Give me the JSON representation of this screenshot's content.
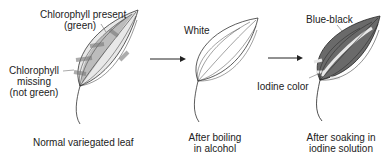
{
  "panels": [
    {
      "caption": "Normal variegated leaf",
      "labels": {
        "top_line1": "Chlorophyll present",
        "top_line2": "(green)",
        "left_line1": "Chlorophyll",
        "left_line2": "missing",
        "left_line3": "(not green)"
      }
    },
    {
      "caption_line1": "After boiling",
      "caption_line2": "in alcohol",
      "labels": {
        "top": "White"
      }
    },
    {
      "caption_line1": "After soaking in",
      "caption_line2": "iodine solution",
      "labels": {
        "top": "Blue-black",
        "left": "Iodine color"
      }
    }
  ],
  "arrows": [
    {
      "from": "panel-1",
      "to": "panel-2"
    },
    {
      "from": "panel-2",
      "to": "panel-3"
    }
  ],
  "colors": {
    "green_region": "#b5b5b5",
    "missing_region": "#eeeeee",
    "blue_black": "#6e6e6e",
    "outline": "#333333"
  }
}
